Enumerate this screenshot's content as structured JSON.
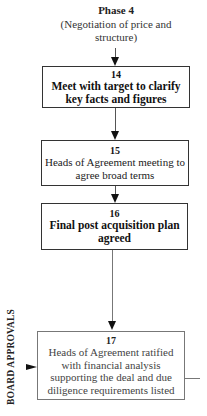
{
  "phase": {
    "title": "Phase 4",
    "subtitle": "(Negotiation of price and structure)"
  },
  "steps": [
    {
      "number": "14",
      "text": "Meet with target to clarify key facts and figures"
    },
    {
      "number": "15",
      "text": "Heads of Agreement meeting to agree broad terms"
    },
    {
      "number": "16",
      "text": "Final post acquisition plan agreed"
    },
    {
      "number": "17",
      "text": "Heads of Agreement ratified with financial analysis supporting the deal and due diligence requirements listed"
    }
  ],
  "side_label": "BOARD APPROVALS",
  "colors": {
    "border": "#333333",
    "light_border": "#777777",
    "text": "#222222"
  }
}
